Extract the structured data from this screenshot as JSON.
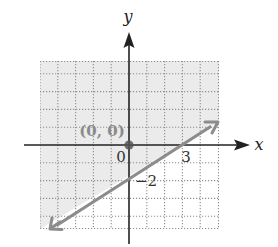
{
  "graph": {
    "type": "linear-inequality",
    "axes": {
      "x_label": "x",
      "y_label": "y",
      "origin_label": "0"
    },
    "line": {
      "x_intercept": 3,
      "y_intercept": -2,
      "x_intercept_label": "3",
      "y_intercept_label": "−2",
      "style": "solid"
    },
    "test_point": {
      "label": "(0, 0)",
      "x": 0,
      "y": 0
    },
    "shading": {
      "region": "above-left of line, containing (0, 0)",
      "color": "#ebebeb"
    },
    "colors": {
      "axis": "#222222",
      "line": "#8c8c8c",
      "grid": "#9a9a9a",
      "test_point": "#555555",
      "test_point_label": "#8a8a8a"
    },
    "grid": {
      "x_range": [
        -5,
        5
      ],
      "y_range": [
        -4.7,
        4.7
      ]
    }
  }
}
